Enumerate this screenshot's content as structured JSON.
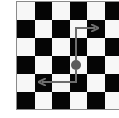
{
  "diagram": {
    "type": "chessboard-move-diagram",
    "board": {
      "rows": 6,
      "cols": 6,
      "top_left_color": "light",
      "colors": {
        "light": "#f7f7f7",
        "dark": "#050505",
        "border": "#8a8a8a"
      }
    },
    "piece": {
      "icon": "circle-piece-icon",
      "row": 3,
      "col": 3,
      "color": "#5a5a5a"
    },
    "arrows": [
      {
        "name": "move-up-right",
        "path": "up 2, right 1",
        "color": "#6e6e6e"
      },
      {
        "name": "move-down-left",
        "path": "down 1, left 2",
        "color": "#6e6e6e"
      }
    ]
  }
}
